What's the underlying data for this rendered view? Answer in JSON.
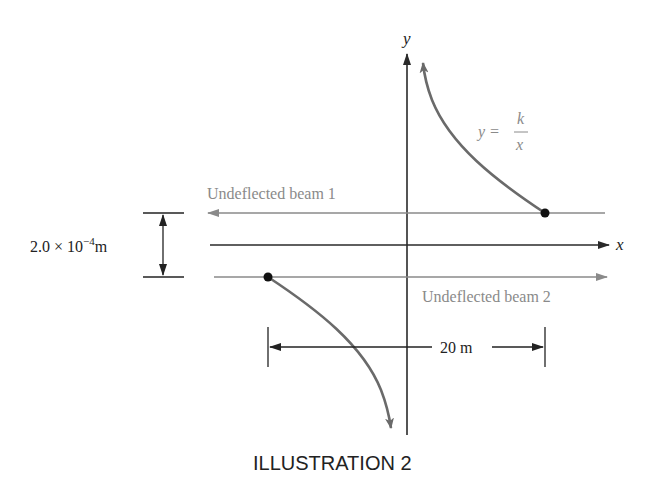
{
  "diagram": {
    "axes": {
      "x_label": "x",
      "y_label": "y"
    },
    "curve_label": {
      "lhs": "y =",
      "numerator": "k",
      "denominator": "x"
    },
    "beams": [
      {
        "label": "Undeflected beam 1",
        "direction": "left"
      },
      {
        "label": "Undeflected beam 2",
        "direction": "right"
      }
    ],
    "separation_label": {
      "mantissa": "2.0 × 10",
      "exponent": "−4",
      "unit": "m"
    },
    "distance_label": "20 m",
    "caption": "ILLUSTRATION 2",
    "colors": {
      "axis": "#2a2a2a",
      "beam": "#8a8a8a",
      "curve": "#6a6a6a",
      "label_gray": "#8a8a8a",
      "text_dark": "#222222"
    }
  }
}
